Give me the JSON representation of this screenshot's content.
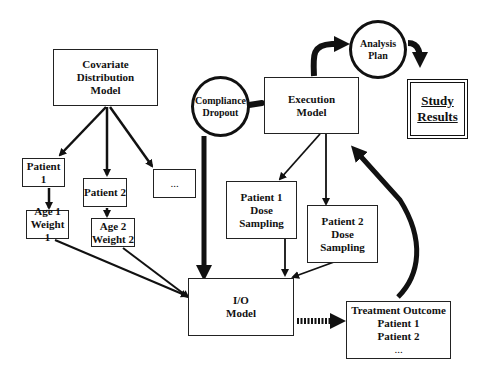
{
  "nodes": {
    "covariate": {
      "line1": "Covariate Distribution",
      "line2": "Model"
    },
    "patient1": {
      "label": "Patient 1"
    },
    "patient2": {
      "label": "Patient 2"
    },
    "ellipsis_box": {
      "label": "..."
    },
    "age1": {
      "line1": "Age 1",
      "line2": "Weight 1"
    },
    "age2": {
      "line1": "Age 2",
      "line2": "Weight 2"
    },
    "compliance": {
      "line1": "Compliance",
      "line2": "Dropout"
    },
    "execution": {
      "line1": "Execution",
      "line2": "Model"
    },
    "analysis": {
      "line1": "Analysis",
      "line2": "Plan"
    },
    "study_results": {
      "line1": "Study",
      "line2": "Results"
    },
    "p1_dose": {
      "line1": "Patient 1",
      "line2": "Dose",
      "line3": "Sampling"
    },
    "p2_dose": {
      "line1": "Patient 2",
      "line2": "Dose",
      "line3": "Sampling"
    },
    "io_model": {
      "line1": "I/O",
      "line2": "Model"
    },
    "treatment": {
      "line1": "Treatment Outcome",
      "line2": "Patient 1",
      "line3": "Patient 2",
      "line4": "..."
    }
  },
  "colors": {
    "stroke": "#111111",
    "background": "#ffffff"
  }
}
